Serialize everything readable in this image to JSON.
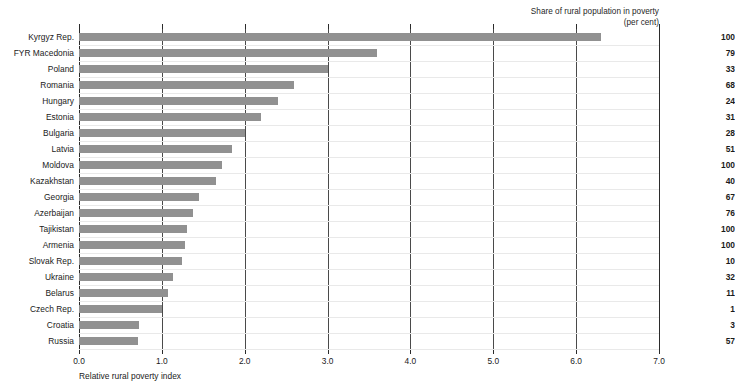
{
  "chart_data": {
    "type": "bar",
    "orientation": "horizontal",
    "title": "",
    "xlabel": "Relative rural poverty index",
    "ylabel": "",
    "xlim": [
      0.0,
      7.0
    ],
    "xticks": [
      "0.0",
      "1.0",
      "2.0",
      "3.0",
      "4.0",
      "5.0",
      "6.0",
      "7.0"
    ],
    "xtick_values": [
      0.0,
      1.0,
      2.0,
      3.0,
      4.0,
      5.0,
      6.0,
      7.0
    ],
    "grid": "vertical",
    "legend": "none",
    "bar_color": "#919191",
    "categories": [
      "Kyrgyz Rep.",
      "FYR Macedonia",
      "Poland",
      "Romania",
      "Hungary",
      "Estonia",
      "Bulgaria",
      "Latvia",
      "Moldova",
      "Kazakhstan",
      "Georgia",
      "Azerbaijan",
      "Tajikistan",
      "Armenia",
      "Slovak Rep.",
      "Ukraine",
      "Belarus",
      "Czech Rep.",
      "Croatia",
      "Russia"
    ],
    "values": [
      6.3,
      3.6,
      3.0,
      2.6,
      2.4,
      2.2,
      2.0,
      1.85,
      1.72,
      1.65,
      1.45,
      1.37,
      1.3,
      1.28,
      1.24,
      1.13,
      1.07,
      1.0,
      0.72,
      0.71
    ],
    "secondary_column": {
      "header_line1": "Share of rural population in poverty",
      "header_line2": "(per cent)",
      "values": [
        100,
        79,
        33,
        68,
        24,
        31,
        28,
        51,
        100,
        40,
        67,
        76,
        100,
        100,
        10,
        32,
        11,
        1,
        3,
        57
      ]
    }
  }
}
